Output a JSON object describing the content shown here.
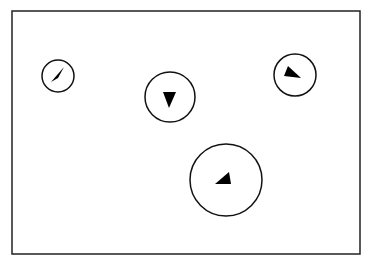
{
  "diagram": {
    "canvas": {
      "width": 370,
      "height": 265,
      "background": "#ffffff"
    },
    "frame": {
      "x": 12,
      "y": 11,
      "width": 348,
      "height": 243,
      "stroke": "#222222",
      "stroke_width": 1.5
    },
    "stroke_color": "#111111",
    "fill_color": "#000000",
    "markers": [
      {
        "id": "marker-1",
        "circle": {
          "cx": 58,
          "cy": 76,
          "r": 16
        },
        "arrow_direction": "north-east",
        "arrow_points": "64,67 51,82 58,78"
      },
      {
        "id": "marker-2",
        "circle": {
          "cx": 170,
          "cy": 97,
          "r": 25
        },
        "arrow_direction": "south",
        "arrow_points": "163,92 176,92 169,108"
      },
      {
        "id": "marker-3",
        "circle": {
          "cx": 295,
          "cy": 75,
          "r": 21
        },
        "arrow_direction": "east-south-east",
        "arrow_points": "288,66 284,76 301,78"
      },
      {
        "id": "marker-4",
        "circle": {
          "cx": 226,
          "cy": 180,
          "r": 36
        },
        "arrow_direction": "north-east",
        "arrow_points": "229,172 215,184 231,184"
      }
    ]
  }
}
